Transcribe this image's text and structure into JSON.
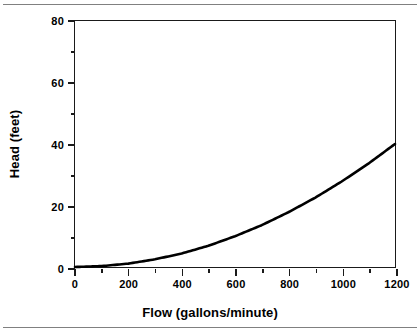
{
  "chart_data": {
    "type": "line",
    "title": "",
    "xlabel": "Flow (gallons/minute)",
    "ylabel": "Head (feet)",
    "xlim": [
      0,
      1200
    ],
    "ylim": [
      0,
      80
    ],
    "grid": false,
    "legend": false,
    "line_color": "#000000",
    "background_color": "#ffffff",
    "axis_color": "#1a1a1a",
    "xticks": [
      0,
      200,
      400,
      600,
      800,
      1000,
      1200
    ],
    "xtick_labels": [
      "0",
      "200",
      "400",
      "600",
      "800",
      "1000",
      "1200"
    ],
    "xticks_minor": [
      100,
      300,
      500,
      700,
      900,
      1100
    ],
    "yticks": [
      0,
      20,
      40,
      60,
      80
    ],
    "ytick_labels": [
      "0",
      "20",
      "40",
      "60",
      "80"
    ],
    "yticks_minor": [
      10,
      30,
      50,
      70
    ],
    "series": [
      {
        "name": "System head curve",
        "x": [
          0,
          100,
          200,
          300,
          400,
          500,
          600,
          700,
          800,
          900,
          1000,
          1100,
          1200
        ],
        "y": [
          0.0,
          0.3,
          1.1,
          2.5,
          4.4,
          6.9,
          10.0,
          13.6,
          17.8,
          22.5,
          27.8,
          33.6,
          40.0
        ]
      }
    ]
  },
  "rules": {
    "top_label": "top-divider",
    "bottom_label": "bottom-divider"
  }
}
